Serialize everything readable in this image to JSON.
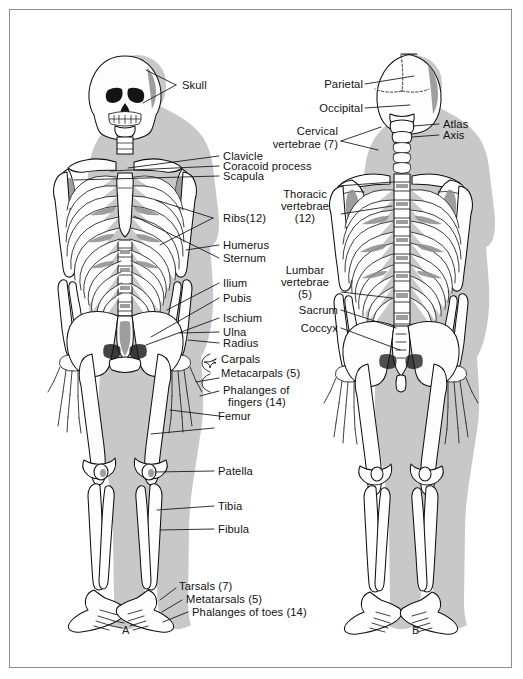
{
  "figure": {
    "panels": [
      {
        "letter": "A",
        "view": "anterior"
      },
      {
        "letter": "B",
        "view": "posterior"
      }
    ],
    "colors": {
      "page_background": "#ffffff",
      "border": "#8e8e8e",
      "body_silhouette": "#c8c8c8",
      "bone_fill": "#fdfdfd",
      "bone_outline": "#101010",
      "bone_shadow": "#8d8d8d",
      "label_text": "#111111"
    }
  },
  "anterior_labels": [
    {
      "id": "skull",
      "text": "Skull"
    },
    {
      "id": "clavicle",
      "text": "Clavicle"
    },
    {
      "id": "coracoid-process",
      "text": "Coracoid process"
    },
    {
      "id": "scapula",
      "text": "Scapula"
    },
    {
      "id": "ribs",
      "text": "Ribs(12)"
    },
    {
      "id": "humerus",
      "text": "Humerus"
    },
    {
      "id": "sternum",
      "text": "Sternum"
    },
    {
      "id": "ilium",
      "text": "Ilium"
    },
    {
      "id": "pubis",
      "text": "Pubis"
    },
    {
      "id": "ischium",
      "text": "Ischium"
    },
    {
      "id": "ulna",
      "text": "Ulna"
    },
    {
      "id": "radius",
      "text": "Radius"
    },
    {
      "id": "carpals",
      "text": "Carpals"
    },
    {
      "id": "metacarpals",
      "text": "Metacarpals (5)"
    },
    {
      "id": "phalanges-fingers-1",
      "text": "Phalanges of"
    },
    {
      "id": "phalanges-fingers-2",
      "text": "fingers (14)"
    },
    {
      "id": "femur",
      "text": "Femur"
    },
    {
      "id": "patella",
      "text": "Patella"
    },
    {
      "id": "tibia",
      "text": "Tibia"
    },
    {
      "id": "fibula",
      "text": "Fibula"
    },
    {
      "id": "tarsals",
      "text": "Tarsals (7)"
    },
    {
      "id": "metatarsals",
      "text": "Metatarsals (5)"
    },
    {
      "id": "phalanges-toes",
      "text": "Phalanges of toes (14)"
    }
  ],
  "posterior_labels": [
    {
      "id": "parietal",
      "text": "Parietal"
    },
    {
      "id": "occipital",
      "text": "Occipital"
    },
    {
      "id": "cervical-vertebrae-1",
      "text": "Cervical"
    },
    {
      "id": "cervical-vertebrae-2",
      "text": "vertebrae (7)"
    },
    {
      "id": "atlas",
      "text": "Atlas"
    },
    {
      "id": "axis",
      "text": "Axis"
    },
    {
      "id": "thoracic-vertebrae-1",
      "text": "Thoracic"
    },
    {
      "id": "thoracic-vertebrae-2",
      "text": "vertebrae"
    },
    {
      "id": "thoracic-vertebrae-3",
      "text": "(12)"
    },
    {
      "id": "lumbar-vertebrae-1",
      "text": "Lumbar"
    },
    {
      "id": "lumbar-vertebrae-2",
      "text": "vertebrae"
    },
    {
      "id": "lumbar-vertebrae-3",
      "text": "(5)"
    },
    {
      "id": "sacrum",
      "text": "Sacrum"
    },
    {
      "id": "coccyx",
      "text": "Coccyx"
    }
  ]
}
